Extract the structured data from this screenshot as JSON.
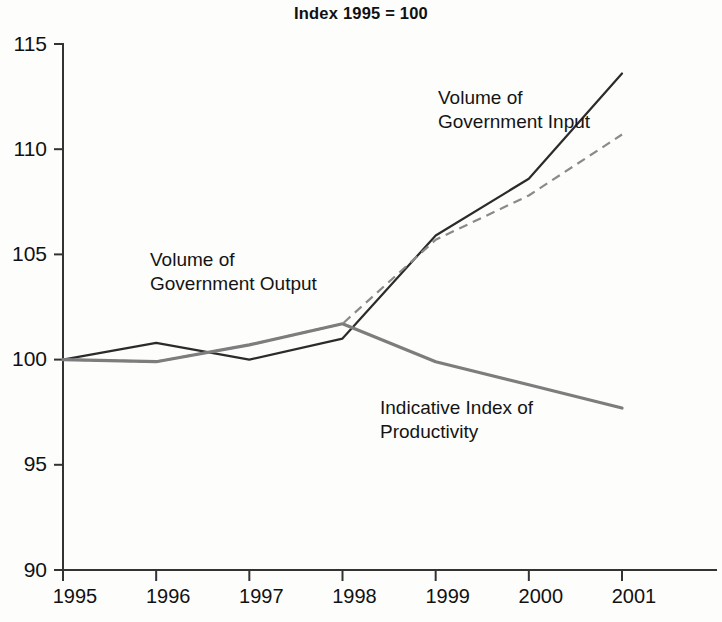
{
  "chart_data": {
    "type": "line",
    "title": "Index 1995 = 100",
    "xlabel": "",
    "ylabel": "",
    "x": [
      1995,
      1996,
      1997,
      1998,
      1999,
      2000,
      2001
    ],
    "categories": [
      "1995",
      "1996",
      "1997",
      "1998",
      "1999",
      "2000",
      "2001"
    ],
    "xlim": [
      1995,
      2001
    ],
    "ylim": [
      90,
      115
    ],
    "ytick_labels": [
      "115",
      "110",
      "105",
      "100",
      "95",
      "90"
    ],
    "yticks": [
      115,
      110,
      105,
      100,
      95,
      90
    ],
    "grid": false,
    "legend_position": "inline-annotations",
    "series": [
      {
        "name": "Volume of Government Input",
        "style": "solid",
        "color": "#2b2b2b",
        "values": [
          100.0,
          100.8,
          100.0,
          101.0,
          105.9,
          108.6,
          113.6
        ]
      },
      {
        "name": "Volume of Government Output",
        "style": "dashed",
        "color": "#8a8a8a",
        "values": [
          100.0,
          99.9,
          100.7,
          101.7,
          105.7,
          107.8,
          110.7
        ]
      },
      {
        "name": "Indicative Index of Productivity",
        "style": "solid-thick",
        "color": "#7d7d7d",
        "values": [
          100.0,
          99.9,
          100.7,
          101.7,
          99.9,
          98.8,
          97.7
        ]
      }
    ],
    "annotations": [
      {
        "id": "input",
        "text": "Volume of\nGovernment Input"
      },
      {
        "id": "output",
        "text": "Volume of\nGovernment Output"
      },
      {
        "id": "productivity",
        "text": "Indicative Index of\nProductivity"
      }
    ]
  }
}
